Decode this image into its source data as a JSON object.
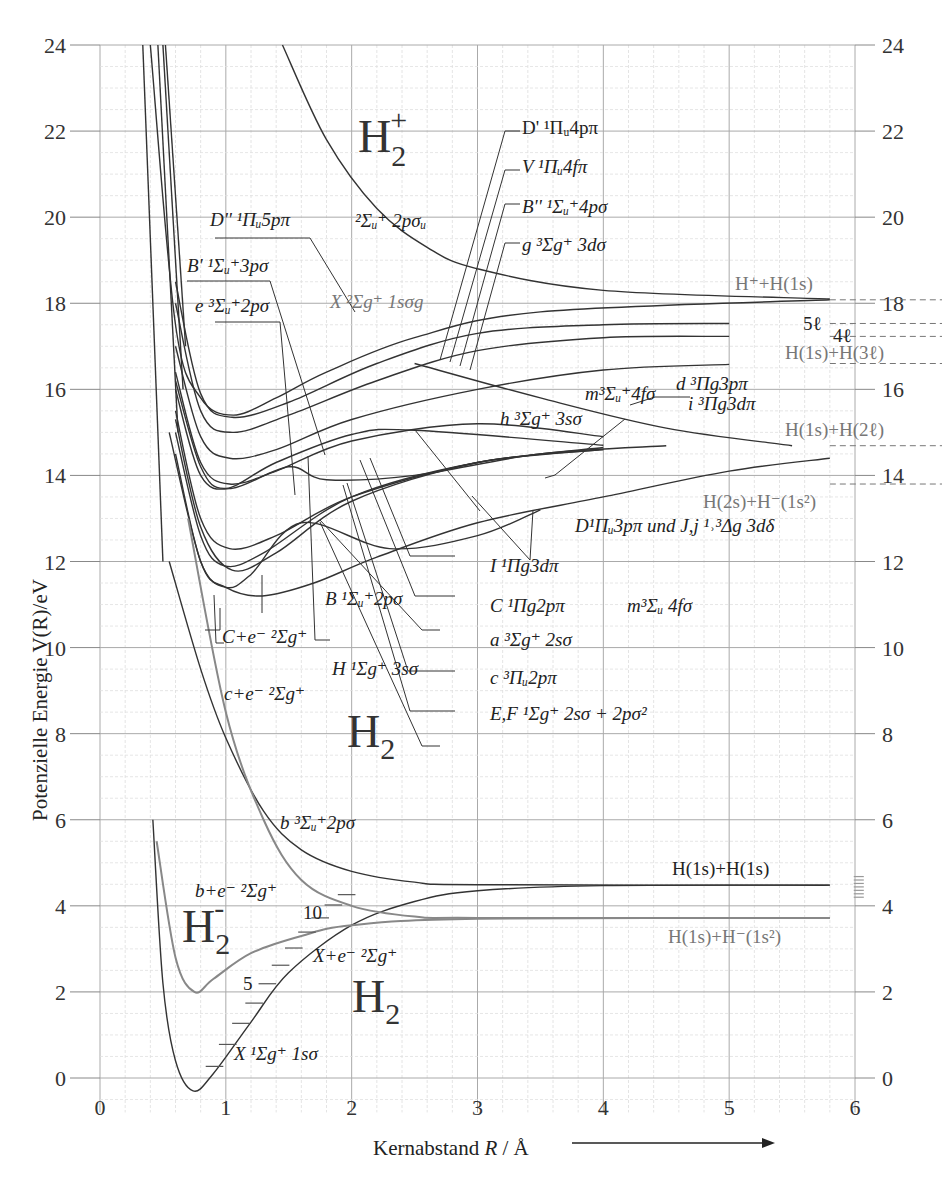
{
  "chart_data": {
    "type": "line",
    "title": "",
    "xlabel": "Kernabstand R / Å",
    "ylabel": "Potenzielle Energie V(R)/eV",
    "xlim": [
      0,
      6
    ],
    "ylim": [
      0,
      24
    ],
    "x_ticks": [
      "0",
      "1",
      "2",
      "3",
      "4",
      "5",
      "6"
    ],
    "y_ticks": [
      "0",
      "2",
      "4",
      "6",
      "8",
      "10",
      "12",
      "14",
      "16",
      "18",
      "20",
      "22",
      "24"
    ],
    "grid": true,
    "legend": "none (direct curve annotations)",
    "molecule_labels": [
      "H2+",
      "H2",
      "H2",
      "H2-"
    ],
    "asymptotes": [
      {
        "label": "H⁺+H(1s)",
        "energy": 18.08
      },
      {
        "label": "5ℓ",
        "energy": 17.53
      },
      {
        "label": "4ℓ",
        "energy": 17.23
      },
      {
        "label": "H(1s)+H(3ℓ)",
        "energy": 16.6
      },
      {
        "label": "H(1s)+H(2ℓ)",
        "energy": 14.69
      },
      {
        "label": "H(2s)+H⁻(1s²)",
        "energy": 13.8
      },
      {
        "label": "H(1s)+H(1s)",
        "energy": 4.48
      },
      {
        "label": "H(1s)+H⁻(1s²)",
        "energy": 3.73
      }
    ],
    "series": [
      {
        "name": "X 1Σg+ 1sσ",
        "molecule": "H2",
        "points": [
          [
            0.42,
            6.0
          ],
          [
            0.5,
            2.2
          ],
          [
            0.6,
            0.4
          ],
          [
            0.74,
            -0.3
          ],
          [
            0.9,
            0.1
          ],
          [
            1.2,
            1.3
          ],
          [
            1.5,
            2.45
          ],
          [
            2.0,
            3.55
          ],
          [
            2.5,
            4.1
          ],
          [
            3.0,
            4.35
          ],
          [
            4.0,
            4.47
          ],
          [
            5.8,
            4.48
          ]
        ]
      },
      {
        "name": "b 3Σu+ 2pσ",
        "molecule": "H2",
        "points": [
          [
            0.55,
            12.0
          ],
          [
            0.8,
            9.5
          ],
          [
            1.0,
            7.9
          ],
          [
            1.3,
            6.2
          ],
          [
            1.6,
            5.3
          ],
          [
            2.0,
            4.8
          ],
          [
            2.5,
            4.55
          ],
          [
            3.0,
            4.49
          ],
          [
            5.8,
            4.48
          ]
        ]
      },
      {
        "name": "X 2Σg+ 1sσg (H2+)",
        "molecule": "H2+",
        "points": [
          [
            0.4,
            24.0
          ],
          [
            0.6,
            17.5
          ],
          [
            0.8,
            15.8
          ],
          [
            1.06,
            15.4
          ],
          [
            1.4,
            15.8
          ],
          [
            1.8,
            16.4
          ],
          [
            2.5,
            17.2
          ],
          [
            3.5,
            17.8
          ],
          [
            5.8,
            18.08
          ]
        ]
      },
      {
        "name": "2Σu+ 2pσu (H2+)",
        "molecule": "H2+",
        "points": [
          [
            1.45,
            24.0
          ],
          [
            1.8,
            21.8
          ],
          [
            2.2,
            20.2
          ],
          [
            2.6,
            19.3
          ],
          [
            3.0,
            18.8
          ],
          [
            4.0,
            18.3
          ],
          [
            5.8,
            18.1
          ]
        ]
      },
      {
        "name": "B 1Σu+ 2pσ",
        "molecule": "H2",
        "points": [
          [
            0.55,
            15.0
          ],
          [
            0.8,
            12.0
          ],
          [
            1.0,
            11.4
          ],
          [
            1.29,
            11.2
          ],
          [
            1.7,
            11.5
          ],
          [
            2.2,
            12.1
          ],
          [
            3.0,
            12.9
          ],
          [
            4.0,
            13.5
          ],
          [
            5.0,
            14.1
          ],
          [
            5.8,
            14.4
          ]
        ]
      },
      {
        "name": "C 1Πu 2pπ",
        "molecule": "H2",
        "points": [
          [
            0.6,
            15.5
          ],
          [
            0.8,
            13.0
          ],
          [
            1.03,
            12.3
          ],
          [
            1.4,
            12.6
          ],
          [
            2.0,
            13.5
          ],
          [
            3.0,
            14.3
          ],
          [
            4.0,
            14.65
          ]
        ]
      },
      {
        "name": "E,F 1Σg+ 2sσ+2pσ²",
        "molecule": "H2",
        "points": [
          [
            0.6,
            14.5
          ],
          [
            0.8,
            12.0
          ],
          [
            1.0,
            11.4
          ],
          [
            1.2,
            11.7
          ],
          [
            1.6,
            12.9
          ],
          [
            2.3,
            12.3
          ],
          [
            3.0,
            12.6
          ],
          [
            3.5,
            13.2
          ]
        ]
      },
      {
        "name": "a 3Σg+ 2sσ",
        "molecule": "H2",
        "points": [
          [
            0.6,
            15.0
          ],
          [
            0.8,
            12.6
          ],
          [
            0.99,
            11.9
          ],
          [
            1.3,
            12.2
          ],
          [
            2.0,
            13.5
          ],
          [
            3.0,
            14.3
          ],
          [
            4.0,
            14.6
          ]
        ]
      },
      {
        "name": "c 3Πu 2pπ",
        "molecule": "H2",
        "points": [
          [
            0.6,
            15.3
          ],
          [
            0.8,
            12.8
          ],
          [
            1.05,
            11.8
          ],
          [
            1.4,
            12.2
          ],
          [
            2.0,
            13.4
          ],
          [
            3.0,
            14.3
          ],
          [
            4.0,
            14.6
          ]
        ]
      },
      {
        "name": "H2- (b+e⁻ 2Σg+)",
        "molecule": "H2-",
        "points": [
          [
            0.45,
            5.5
          ],
          [
            0.6,
            2.8
          ],
          [
            0.75,
            2.0
          ],
          [
            0.9,
            2.3
          ],
          [
            1.2,
            2.9
          ],
          [
            1.6,
            3.3
          ],
          [
            2.0,
            3.55
          ],
          [
            3.0,
            3.7
          ],
          [
            5.8,
            3.72
          ]
        ]
      },
      {
        "name": "b+e⁻ 2Σg+",
        "molecule": "H2-",
        "points": [
          [
            0.7,
            13.0
          ],
          [
            1.0,
            8.5
          ],
          [
            1.3,
            6.0
          ],
          [
            1.6,
            4.6
          ],
          [
            2.0,
            4.0
          ],
          [
            2.5,
            3.75
          ],
          [
            3.0,
            3.72
          ],
          [
            5.8,
            3.72
          ]
        ]
      },
      {
        "name": "D 1Πu 3pπ",
        "molecule": "H2",
        "points": [
          [
            0.6,
            17.0
          ],
          [
            0.8,
            14.9
          ],
          [
            1.03,
            14.4
          ],
          [
            1.4,
            14.6
          ],
          [
            2.0,
            15.3
          ],
          [
            3.0,
            16.0
          ],
          [
            4.0,
            16.45
          ],
          [
            5.0,
            16.58
          ]
        ]
      },
      {
        "name": "B' 1Σu+ 3pσ",
        "molecule": "H2",
        "points": [
          [
            0.6,
            16.4
          ],
          [
            0.8,
            14.3
          ],
          [
            1.03,
            13.8
          ],
          [
            1.4,
            14.1
          ],
          [
            2.0,
            14.8
          ],
          [
            3.0,
            15.2
          ],
          [
            4.0,
            14.9
          ]
        ]
      },
      {
        "name": "e 3Σu+ 2pσ",
        "molecule": "H2",
        "points": [
          [
            0.6,
            16.0
          ],
          [
            0.8,
            14.0
          ],
          [
            1.05,
            13.7
          ],
          [
            1.5,
            14.2
          ],
          [
            1.8,
            13.9
          ],
          [
            2.5,
            14.0
          ],
          [
            3.5,
            14.5
          ],
          [
            4.5,
            14.69
          ]
        ]
      },
      {
        "name": "H 1Σg+ 3sσ",
        "molecule": "H2",
        "points": [
          [
            0.6,
            16.2
          ],
          [
            0.8,
            14.2
          ],
          [
            1.0,
            13.7
          ],
          [
            1.4,
            14.3
          ],
          [
            2.0,
            14.95
          ],
          [
            2.5,
            15.05
          ],
          [
            4.0,
            14.7
          ]
        ]
      },
      {
        "name": "D' 1Πu 4pπ",
        "molecule": "H2",
        "points": [
          [
            0.6,
            18.0
          ],
          [
            0.8,
            15.5
          ],
          [
            1.05,
            15.0
          ],
          [
            1.5,
            15.4
          ],
          [
            2.2,
            16.2
          ],
          [
            3.0,
            16.9
          ],
          [
            4.0,
            17.2
          ],
          [
            5.0,
            17.23
          ]
        ]
      },
      {
        "name": "D'' 1Πu 5pπ",
        "molecule": "H2",
        "points": [
          [
            0.6,
            18.5
          ],
          [
            0.8,
            15.9
          ],
          [
            1.05,
            15.35
          ],
          [
            1.5,
            15.7
          ],
          [
            2.2,
            16.6
          ],
          [
            3.0,
            17.3
          ],
          [
            4.0,
            17.5
          ],
          [
            5.0,
            17.53
          ]
        ]
      },
      {
        "name": "m 3Σu+ 4fσ",
        "molecule": "H2",
        "points": [
          [
            2.5,
            16.6
          ],
          [
            3.5,
            15.8
          ],
          [
            4.5,
            15.1
          ],
          [
            5.5,
            14.69
          ]
        ]
      }
    ]
  },
  "axes": {
    "x_title_prefix": "Kernabstand ",
    "x_title_var": "R",
    "x_title_suffix": " / Å",
    "y_title": "Potenzielle Energie V(R)/eV"
  },
  "annotations": {
    "h2plus": "H",
    "h2plus_sub": "2",
    "h2plus_sup": "+",
    "h2_main": "H",
    "h2_sub": "2",
    "h2_lower": "H",
    "h2_lower_sub": "2",
    "h2minus": "H",
    "h2minus_sub": "2",
    "h2minus_sup": "-",
    "sigma_u_2psigma": "²Σᵤ⁺ 2pσᵤ",
    "x2_sigma_g": "X ²Σg⁺ 1sσg",
    "d2_pi_5p": "D'' ¹Πᵤ5pπ",
    "bprime_3psigma": "B' ¹Σᵤ⁺3pσ",
    "e_2psigma": "e ³Σᵤ⁺2pσ",
    "dprime_4ppi": "D' ¹Πᵤ4pπ",
    "v_4fpi": "V ¹Πᵤ4fπ",
    "b2_4psigma": "B'' ¹Σᵤ⁺4pσ",
    "g_3dsigma": "g ³Σg⁺ 3dσ",
    "h_plus_h1s": "H⁺+H(1s)",
    "five_l": "5ℓ",
    "four_l": "4ℓ",
    "d3_3ppi": "d ³Πg3pπ",
    "h1s_h3l": "H(1s)+H(3ℓ)",
    "m_4fsigma": "m³Σᵤ⁺4fσ",
    "i_3dpi": "i ³Πg3dπ",
    "h_3ssigma": "h ³Σg⁺ 3sσ",
    "h1s_h2l": "H(1s)+H(2ℓ)",
    "h2s_hminus": "H(2s)+H⁻(1s²)",
    "d1_und_j": "D¹Πᵤ3pπ und J,j ¹˒³Δg 3dδ",
    "i1_3dpi": "I ¹Πg3dπ",
    "c1_2ppi": "C ¹Πg2pπ",
    "m3_4fsigma": "m³Σᵤ 4fσ",
    "a3_2ssigma": "a ³Σg⁺ 2sσ",
    "c3_2ppi": "c ³Πᵤ2pπ",
    "ef_label": "E,F ¹Σg⁺ 2sσ + 2pσ²",
    "b1_2psigma": "B ¹Σᵤ⁺2pσ",
    "c_plus_e": "C+e⁻ ²Σg⁺",
    "h1_3ssigma": "H ¹Σg⁺ 3sσ",
    "c_small_plus_e": "c+e⁻ ²Σg⁺",
    "b3_2psigma": "b ³Σᵤ⁺2pσ",
    "h1s_h1s": "H(1s)+H(1s)",
    "b_plus_e": "b+e⁻ ²Σg⁺",
    "vib_10": "10",
    "vib_5": "5",
    "x_plus_e": "X+e⁻ ²Σg⁺",
    "h1s_hminus": "H(1s)+H⁻(1s²)",
    "x1_1ssigma": "X ¹Σg⁺ 1sσ"
  }
}
